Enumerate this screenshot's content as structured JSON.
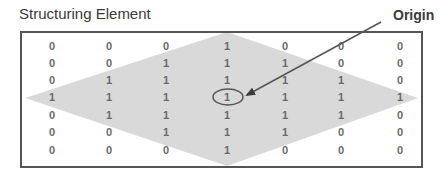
{
  "title": "Structuring Element",
  "origin_label": "Origin",
  "colors": {
    "diamond_fill": "#d9d9d9",
    "frame": "#555555",
    "text": "#3a3a3a",
    "cell_text": "#6a6a6a",
    "arrow": "#555555"
  },
  "grid": {
    "rows": 7,
    "cols": 7,
    "values": [
      [
        0,
        0,
        0,
        1,
        0,
        0,
        0
      ],
      [
        0,
        0,
        1,
        1,
        1,
        0,
        0
      ],
      [
        0,
        1,
        1,
        1,
        1,
        1,
        0
      ],
      [
        1,
        1,
        1,
        1,
        1,
        1,
        1
      ],
      [
        0,
        1,
        1,
        1,
        1,
        1,
        0
      ],
      [
        0,
        0,
        1,
        1,
        1,
        0,
        0
      ],
      [
        0,
        0,
        0,
        1,
        0,
        0,
        0
      ]
    ],
    "origin": {
      "row": 3,
      "col": 3
    }
  }
}
